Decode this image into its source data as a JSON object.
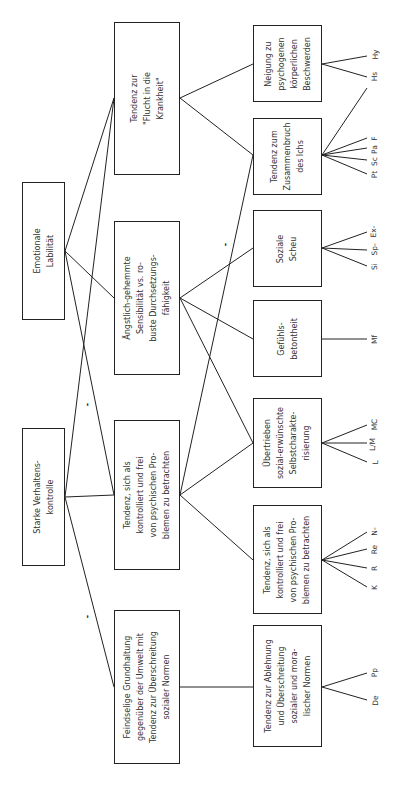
{
  "diagram": {
    "level1": [
      {
        "id": "emo",
        "label": "Emotionale\nLabilität"
      },
      {
        "id": "kon",
        "label": "Starke Verhaltens-\nkontrolle"
      }
    ],
    "level2": [
      {
        "id": "flucht",
        "label": "Tendenz zur\n\"Flucht in die\nKrankheit\""
      },
      {
        "id": "angst",
        "label": "Ängstlich-gehemmte\nSensibilität vs. ro-\nbuste Durchsetzungs-\nfähigkeit"
      },
      {
        "id": "tend",
        "label": "Tendenz, sich als\nkontrolliert und frei\nvon psychischen Pro-\nblemen zu betrachten"
      },
      {
        "id": "feind",
        "label": "Feindselige Grundhaltung\ngegenüber der Umwelt mit\nTendenz zur Überschreitung\nsozialer Normen"
      }
    ],
    "level3": [
      {
        "id": "neig",
        "label": "Neigung zu\npsychogenen\nkörperlichen\nBeschwerden",
        "scales": [
          "Hs",
          "Hy"
        ]
      },
      {
        "id": "zus",
        "label": "Tendenz zum\nZusammenbruch\ndes Ichs",
        "scales": [
          "Pt",
          "Sc",
          "Pa",
          "F"
        ]
      },
      {
        "id": "scheu",
        "label": "Soziale\nScheu",
        "scales": [
          "Si",
          "Sp-",
          "Ex-"
        ]
      },
      {
        "id": "gef",
        "label": "Gefühls-\nbetontheit",
        "scales": [
          "Mf"
        ]
      },
      {
        "id": "ueber",
        "label": "Übertrieben\nsozial-erwünschte\nSelbstcharakte-\nrisierung",
        "scales": [
          "L",
          "L/M",
          "MC"
        ]
      },
      {
        "id": "tend2",
        "label": "Tendenz, sich als\nkontrolliert und frei\nvon psychischen Pro-\nblemen zu betrachten",
        "scales": [
          "K",
          "R",
          "Re",
          "N-"
        ]
      },
      {
        "id": "abl",
        "label": "Tendenz zur Ablehnung\nund Überschreitung\nsozialer und mora-\nlischer Normen",
        "scales": [
          "De",
          "Pp"
        ]
      }
    ],
    "negative_marks": [
      "-",
      "-",
      "-"
    ]
  }
}
